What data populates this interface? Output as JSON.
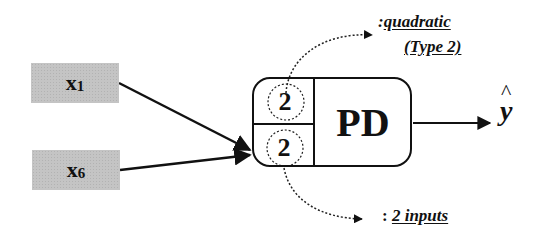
{
  "inputs": [
    {
      "var": "x",
      "sub": "1"
    },
    {
      "var": "x",
      "sub": "6"
    }
  ],
  "node": {
    "label": "PD",
    "top_value": "2",
    "bottom_value": "2"
  },
  "annotations": {
    "top_colon": ":",
    "top_line1": "quadratic",
    "top_line2": "(Type 2)",
    "bottom_colon": ": ",
    "bottom_text": "2 inputs"
  },
  "output": {
    "symbol": "y",
    "hat": "^"
  },
  "colors": {
    "input_fill": "#c4c4c4",
    "stroke": "#111111"
  }
}
